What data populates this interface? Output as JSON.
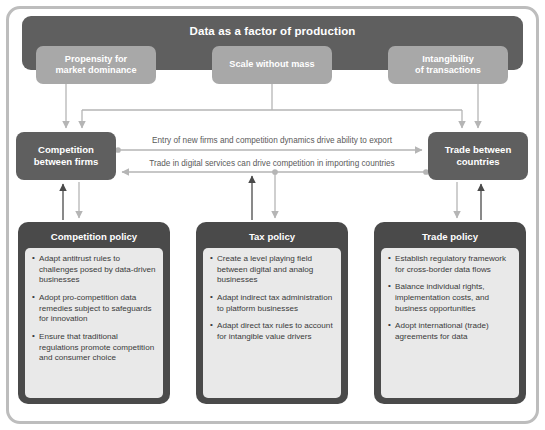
{
  "banner": {
    "title": "Data as a factor of production"
  },
  "drivers": [
    {
      "id": "propensity",
      "label": "Propensity for\nmarket dominance"
    },
    {
      "id": "scale",
      "label": "Scale without mass"
    },
    {
      "id": "intangibility",
      "label": "Intangibility\nof transactions"
    }
  ],
  "mid_boxes": [
    {
      "id": "competition-between-firms",
      "label": "Competition\nbetween firms"
    },
    {
      "id": "trade-between-countries",
      "label": "Trade between\ncountries"
    }
  ],
  "flows": [
    {
      "id": "firms-to-trade",
      "label": "Entry of new firms and competition dynamics drive ability to export",
      "direction": "right"
    },
    {
      "id": "trade-to-firms",
      "label": "Trade in digital services can drive competition in importing countries",
      "direction": "left"
    }
  ],
  "policies": [
    {
      "id": "competition-policy",
      "title": "Competition policy",
      "bullets": [
        "Adapt antitrust rules to challenges posed by data-driven businesses",
        "Adopt pro-competition data remedies subject to safeguards for innovation",
        "Ensure that traditional regulations promote competition and consumer choice"
      ]
    },
    {
      "id": "tax-policy",
      "title": "Tax policy",
      "bullets": [
        "Create a level playing field between digital and analog businesses",
        "Adapt indirect tax administration to platform businesses",
        "Adapt direct tax rules to account for intangible value drivers"
      ]
    },
    {
      "id": "trade-policy",
      "title": "Trade policy",
      "bullets": [
        "Establish regulatory framework for cross-border data flows",
        "Balance individual rights, implementation costs, and business opportunities",
        "Adopt international (trade) agreements for data"
      ]
    }
  ],
  "colors": {
    "banner_bg": "#5f5f5f",
    "driver_bg": "#a8a8a8",
    "midbox_bg": "#5f5f5f",
    "policy_shell_bg": "#4a4a4a",
    "policy_body_bg": "#e9e9e9",
    "frame_border": "#bdbdbd",
    "connector_light": "#b5b5b5",
    "connector_dark": "#4a4a4a",
    "page_bg": "#ffffff"
  }
}
